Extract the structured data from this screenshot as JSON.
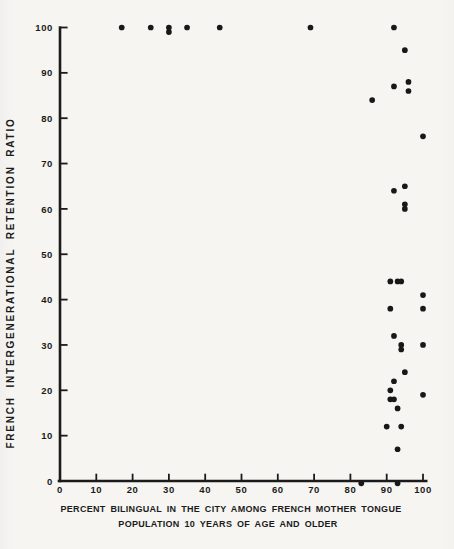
{
  "figure": {
    "background": "#f6f5f2",
    "ink": "#1b1b1b"
  },
  "chart_data": {
    "type": "scatter",
    "title": "",
    "xlabel": "PERCENT BILINGUAL IN THE CITY AMONG FRENCH MOTHER TONGUE POPULATION 10 YEARS OF AGE AND OLDER",
    "xlabel_lines": [
      "PERCENT BILINGUAL IN THE CITY AMONG FRENCH MOTHER TONGUE",
      "POPULATION 10 YEARS OF AGE AND OLDER"
    ],
    "ylabel": "FRENCH INTERGENERATIONAL RETENTION RATIO",
    "xlim": [
      0,
      100
    ],
    "ylim": [
      0,
      100
    ],
    "x_ticks": [
      0,
      10,
      20,
      30,
      40,
      50,
      60,
      70,
      80,
      90,
      100
    ],
    "y_ticks": [
      0,
      10,
      20,
      30,
      40,
      50,
      60,
      70,
      80,
      90,
      100
    ],
    "grid": false,
    "legend": null,
    "marker": "filled-circle",
    "marker_color": "#181818",
    "points": [
      [
        17,
        100
      ],
      [
        25,
        100
      ],
      [
        30,
        100
      ],
      [
        30,
        99
      ],
      [
        35,
        100
      ],
      [
        44,
        100
      ],
      [
        69,
        100
      ],
      [
        92,
        100
      ],
      [
        95,
        95
      ],
      [
        96,
        88
      ],
      [
        92,
        87
      ],
      [
        96,
        86
      ],
      [
        86,
        84
      ],
      [
        100,
        76
      ],
      [
        95,
        65
      ],
      [
        92,
        64
      ],
      [
        95,
        61
      ],
      [
        95,
        60
      ],
      [
        91,
        44
      ],
      [
        93,
        44
      ],
      [
        94,
        44
      ],
      [
        100,
        41
      ],
      [
        91,
        38
      ],
      [
        100,
        38
      ],
      [
        92,
        32
      ],
      [
        94,
        30
      ],
      [
        100,
        30
      ],
      [
        94,
        29
      ],
      [
        95,
        24
      ],
      [
        92,
        22
      ],
      [
        91,
        20
      ],
      [
        100,
        19
      ],
      [
        91,
        18
      ],
      [
        92,
        18
      ],
      [
        93,
        16
      ],
      [
        90,
        12
      ],
      [
        94,
        12
      ],
      [
        93,
        7
      ],
      [
        83,
        0
      ],
      [
        93,
        0
      ]
    ]
  }
}
